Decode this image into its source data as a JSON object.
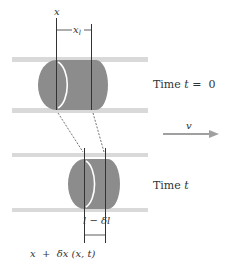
{
  "diagram": {
    "top_state": {
      "position_label": "x",
      "length_label": "x",
      "length_subscript": "l",
      "time_label": "Time t = 0",
      "time_prefix": "Time ",
      "time_var": "t",
      "time_eq": " =  0"
    },
    "velocity": {
      "label": "v"
    },
    "bottom_state": {
      "time_prefix": "Time ",
      "time_var": "t",
      "length_label": "l − δl",
      "position_label": "x  +  δx (x, t)"
    },
    "colors": {
      "cylinder_fill": "#8c8c8c",
      "tube_band": "#d9d9d9",
      "line": "#333333",
      "arrow": "#a0a0a0",
      "ellipse_highlight": "#ffffff"
    }
  }
}
